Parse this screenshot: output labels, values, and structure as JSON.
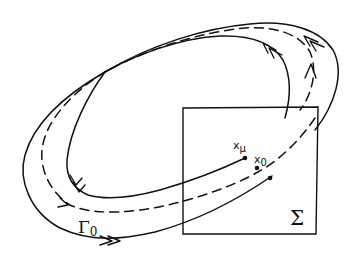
{
  "figure": {
    "type": "poincare-section-diagram",
    "labels": {
      "orbit": "Γ",
      "orbit_sub": "0",
      "section": "Σ",
      "point_mu": "x",
      "point_mu_sub": "μ",
      "point_zero": "x",
      "point_zero_sub": "0"
    },
    "curves": [
      {
        "name": "outer-trajectory",
        "style": "solid"
      },
      {
        "name": "periodic-orbit",
        "style": "dashed"
      },
      {
        "name": "inner-trajectory",
        "style": "solid"
      }
    ],
    "points": [
      {
        "name": "x_mu",
        "on": "inner-trajectory"
      },
      {
        "name": "x_0",
        "on": "periodic-orbit"
      },
      {
        "name": "outer-point",
        "on": "outer-trajectory"
      }
    ],
    "colors": {
      "ink": "#111111",
      "background": "#ffffff"
    }
  }
}
